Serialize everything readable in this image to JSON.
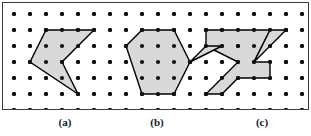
{
  "figure": {
    "width": 311,
    "height": 136,
    "background_color": "#ffffff",
    "border_color": "#3a3a3a",
    "panel": {
      "x": 2,
      "y": 2,
      "width": 307,
      "height": 108
    }
  },
  "grid": {
    "columns": 19,
    "rows": 7,
    "spacing": 16,
    "origin_x": 11,
    "origin_y": 11,
    "dot_radius": 2.1,
    "dot_color": "#111111"
  },
  "style": {
    "polygon_fill": "#d9d9d9",
    "polygon_stroke": "#000000",
    "polygon_stroke_width": 1.4
  },
  "shapes": [
    {
      "id": "polygon-a",
      "label": "(a)",
      "label_x": 65,
      "kind": "non-convex-polygon",
      "vertices_grid": [
        [
          2,
          1
        ],
        [
          4,
          1
        ],
        [
          5,
          1
        ],
        [
          3,
          3
        ],
        [
          4,
          5
        ],
        [
          1,
          3
        ]
      ],
      "points": "43,27 75,27 91,27 59,59 75,91 27,59"
    },
    {
      "id": "polygon-b",
      "label": "(b)",
      "label_x": 157,
      "kind": "convex-polygon",
      "vertices_grid": [
        [
          8,
          1
        ],
        [
          10,
          1
        ],
        [
          11,
          3
        ],
        [
          10,
          5
        ],
        [
          8,
          5
        ],
        [
          7,
          2
        ]
      ],
      "points": "139,27 171,27 187,59 171,91 139,91 123,43"
    },
    {
      "id": "polygon-c",
      "label": "(c)",
      "label_x": 262,
      "kind": "non-convex-polygon",
      "vertices_grid": [
        [
          13,
          1
        ],
        [
          17,
          1
        ],
        [
          14,
          2
        ],
        [
          17,
          1
        ],
        [
          15,
          3
        ],
        [
          17,
          3
        ],
        [
          17,
          4
        ],
        [
          14,
          4
        ],
        [
          13,
          5
        ],
        [
          12,
          5
        ],
        [
          14,
          3
        ],
        [
          11,
          3
        ],
        [
          13,
          2
        ],
        [
          12,
          1
        ]
      ],
      "points": "203,27 267,27 283,27 267,43 283,27 251,59 267,59 267,75 235,75 219,91 203,91 235,59 187,59 219,43 203,27"
    }
  ],
  "shape_c_subpaths": [
    "M203,27 L267,27 L251,59 L267,59 L267,75 L235,75 L219,91 L203,91 L235,59 L203,43 Z",
    "M267,27 L283,27 L251,59 Z",
    "M203,43 L187,59 L219,43 Z"
  ]
}
